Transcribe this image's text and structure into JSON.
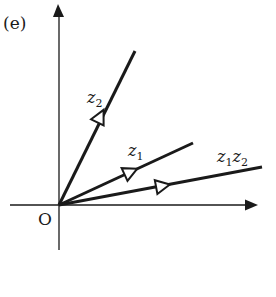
{
  "figure": {
    "panel_label": "(e)",
    "origin_label": "O",
    "colors": {
      "ink": "#1a1a1a",
      "background": "#ffffff"
    }
  },
  "vectors": [
    {
      "id": "z2",
      "label_base": "z",
      "label_sub": "2",
      "angle_deg": 60.5,
      "length": 1.0,
      "arrow": "open-triangle"
    },
    {
      "id": "z1",
      "label_base": "z",
      "label_sub": "1",
      "angle_deg": 25.5,
      "length": 0.9,
      "arrow": "open-triangle"
    },
    {
      "id": "z1z2",
      "label_parts": [
        {
          "base": "z",
          "sub": "1"
        },
        {
          "base": "z",
          "sub": "2"
        }
      ],
      "angle_deg": 9.0,
      "length": 1.28,
      "arrow": "open-triangle"
    }
  ],
  "axes": {
    "x_arrow": true,
    "y_arrow": true
  }
}
